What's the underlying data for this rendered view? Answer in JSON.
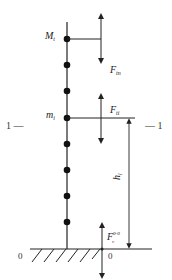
{
  "diagram": {
    "type": "mass-spring column with lateral forces",
    "labels": {
      "top_mass": "M",
      "top_mass_sub": "t",
      "top_force": "F",
      "top_force_sub": "tn",
      "level_mass": "m",
      "level_mass_sub": "i",
      "level_force": "F",
      "level_force_sub": "ti",
      "height": "h",
      "height_sub": "i",
      "base_force": "F",
      "base_force_sub": "v",
      "base_force_sup": "0-0",
      "section_left": "1 —",
      "section_right": "— 1",
      "base_left": "0",
      "base_right": "0"
    },
    "masses_count": 8,
    "colors": {
      "line": "#222222",
      "mass": "#111111",
      "background": "#ffffff"
    }
  }
}
